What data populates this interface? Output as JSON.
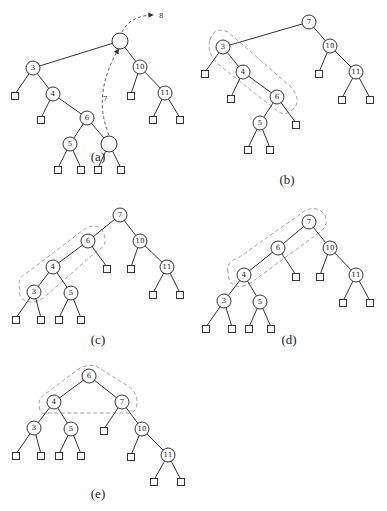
{
  "figure": {
    "panels": [
      {
        "id": "a",
        "caption": "(a)",
        "caption_pos": [
          98,
          161
        ],
        "nodes": [
          {
            "key": "",
            "x": 120,
            "y": 41
          },
          {
            "key": "3",
            "x": 33,
            "y": 68
          },
          {
            "key": "10",
            "x": 140,
            "y": 67
          },
          {
            "key": "4",
            "x": 53,
            "y": 94
          },
          {
            "key": "11",
            "x": 165,
            "y": 93
          },
          {
            "key": "6",
            "x": 87,
            "y": 118
          },
          {
            "key": "5",
            "x": 70,
            "y": 144
          },
          {
            "key": "",
            "x": 109,
            "y": 144
          }
        ],
        "edges": [
          [
            0,
            1
          ],
          [
            0,
            2
          ],
          [
            1,
            3
          ],
          [
            3,
            5
          ],
          [
            5,
            6
          ],
          [
            5,
            7
          ],
          [
            2,
            4
          ]
        ],
        "leaves": [
          {
            "x": 15,
            "y": 94,
            "parent": 1
          },
          {
            "x": 41,
            "y": 118,
            "parent": 3
          },
          {
            "x": 58,
            "y": 168,
            "parent": 6
          },
          {
            "x": 81,
            "y": 168,
            "parent": 6
          },
          {
            "x": 98,
            "y": 168,
            "parent": 7
          },
          {
            "x": 121,
            "y": 168,
            "parent": 7
          },
          {
            "x": 131,
            "y": 94,
            "parent": 2
          },
          {
            "x": 153,
            "y": 118,
            "parent": 4
          },
          {
            "x": 180,
            "y": 118,
            "parent": 4
          }
        ],
        "arrows": [
          {
            "label": "7",
            "path": "M 109 135 Q 92 95 118 50",
            "label_pos": [
              103,
              101
            ]
          },
          {
            "label": "8",
            "path": "M 122 32 Q 130 16 152 15",
            "label_pos": [
              159,
              18
            ]
          }
        ],
        "hull": null
      },
      {
        "id": "b",
        "caption": "(b)",
        "caption_pos": [
          287,
          184
        ],
        "nodes": [
          {
            "key": "7",
            "x": 309,
            "y": 22
          },
          {
            "key": "3",
            "x": 223,
            "y": 47
          },
          {
            "key": "10",
            "x": 330,
            "y": 46
          },
          {
            "key": "4",
            "x": 243,
            "y": 72
          },
          {
            "key": "11",
            "x": 356,
            "y": 72
          },
          {
            "key": "6",
            "x": 277,
            "y": 97
          },
          {
            "key": "5",
            "x": 260,
            "y": 123
          }
        ],
        "edges": [
          [
            0,
            1
          ],
          [
            0,
            2
          ],
          [
            1,
            3
          ],
          [
            3,
            5
          ],
          [
            5,
            6
          ],
          [
            2,
            4
          ]
        ],
        "leaves": [
          {
            "x": 205,
            "y": 72,
            "parent": 1
          },
          {
            "x": 231,
            "y": 97,
            "parent": 3
          },
          {
            "x": 296,
            "y": 123,
            "parent": 5
          },
          {
            "x": 248,
            "y": 148,
            "parent": 6
          },
          {
            "x": 270,
            "y": 148,
            "parent": 6
          },
          {
            "x": 319,
            "y": 72,
            "parent": 2
          },
          {
            "x": 342,
            "y": 98,
            "parent": 4
          },
          {
            "x": 370,
            "y": 98,
            "parent": 4
          }
        ],
        "arrows": [],
        "hull": "M 210 40 Q 214 26 228 32 L 290 86 Q 302 100 294 108 Q 286 118 276 110 L 218 64 Q 206 52 210 40 Z"
      },
      {
        "id": "c",
        "caption": "(c)",
        "caption_pos": [
          98,
          344
        ],
        "nodes": [
          {
            "key": "7",
            "x": 120,
            "y": 215
          },
          {
            "key": "6",
            "x": 88,
            "y": 241
          },
          {
            "key": "10",
            "x": 140,
            "y": 241
          },
          {
            "key": "4",
            "x": 53,
            "y": 267
          },
          {
            "key": "11",
            "x": 167,
            "y": 267
          },
          {
            "key": "3",
            "x": 34,
            "y": 292
          },
          {
            "key": "5",
            "x": 71,
            "y": 293
          }
        ],
        "edges": [
          [
            0,
            1
          ],
          [
            0,
            2
          ],
          [
            1,
            3
          ],
          [
            3,
            5
          ],
          [
            3,
            6
          ],
          [
            2,
            4
          ]
        ],
        "leaves": [
          {
            "x": 107,
            "y": 267,
            "parent": 1
          },
          {
            "x": 16,
            "y": 318,
            "parent": 5
          },
          {
            "x": 41,
            "y": 318,
            "parent": 5
          },
          {
            "x": 59,
            "y": 318,
            "parent": 6
          },
          {
            "x": 81,
            "y": 318,
            "parent": 6
          },
          {
            "x": 131,
            "y": 267,
            "parent": 2
          },
          {
            "x": 153,
            "y": 293,
            "parent": 4
          },
          {
            "x": 180,
            "y": 293,
            "parent": 4
          }
        ],
        "arrows": [],
        "hull": "M 20 290 Q 16 278 28 272 L 86 228 Q 100 222 104 234 Q 108 246 98 250 L 48 294 Q 36 306 24 300 Q 18 296 20 290 Z"
      },
      {
        "id": "d",
        "caption": "(d)",
        "caption_pos": [
          289,
          344
        ],
        "nodes": [
          {
            "key": "7",
            "x": 309,
            "y": 222
          },
          {
            "key": "6",
            "x": 278,
            "y": 248
          },
          {
            "key": "10",
            "x": 330,
            "y": 248
          },
          {
            "key": "4",
            "x": 244,
            "y": 275
          },
          {
            "key": "11",
            "x": 356,
            "y": 275
          },
          {
            "key": "3",
            "x": 224,
            "y": 301
          },
          {
            "key": "5",
            "x": 260,
            "y": 302
          }
        ],
        "edges": [
          [
            0,
            1
          ],
          [
            0,
            2
          ],
          [
            1,
            3
          ],
          [
            3,
            5
          ],
          [
            3,
            6
          ],
          [
            2,
            4
          ]
        ],
        "leaves": [
          {
            "x": 296,
            "y": 275,
            "parent": 1
          },
          {
            "x": 206,
            "y": 327,
            "parent": 5
          },
          {
            "x": 232,
            "y": 327,
            "parent": 5
          },
          {
            "x": 249,
            "y": 327,
            "parent": 6
          },
          {
            "x": 271,
            "y": 327,
            "parent": 6
          },
          {
            "x": 320,
            "y": 275,
            "parent": 2
          },
          {
            "x": 343,
            "y": 301,
            "parent": 4
          },
          {
            "x": 370,
            "y": 301,
            "parent": 4
          }
        ],
        "arrows": [],
        "hull": "M 228 272 Q 226 262 238 258 L 306 210 Q 318 206 324 214 Q 330 224 320 232 L 252 282 Q 240 290 232 284 Q 228 280 228 272 Z"
      },
      {
        "id": "e",
        "caption": "(e)",
        "caption_pos": [
          98,
          498
        ],
        "nodes": [
          {
            "key": "6",
            "x": 89,
            "y": 376
          },
          {
            "key": "4",
            "x": 54,
            "y": 402
          },
          {
            "key": "7",
            "x": 122,
            "y": 402
          },
          {
            "key": "3",
            "x": 34,
            "y": 428
          },
          {
            "key": "5",
            "x": 71,
            "y": 429
          },
          {
            "key": "10",
            "x": 142,
            "y": 429
          },
          {
            "key": "11",
            "x": 168,
            "y": 455
          }
        ],
        "edges": [
          [
            0,
            1
          ],
          [
            0,
            2
          ],
          [
            1,
            3
          ],
          [
            1,
            4
          ],
          [
            2,
            5
          ],
          [
            5,
            6
          ]
        ],
        "leaves": [
          {
            "x": 104,
            "y": 429,
            "parent": 2
          },
          {
            "x": 16,
            "y": 454,
            "parent": 3
          },
          {
            "x": 41,
            "y": 454,
            "parent": 3
          },
          {
            "x": 59,
            "y": 454,
            "parent": 4
          },
          {
            "x": 81,
            "y": 454,
            "parent": 4
          },
          {
            "x": 131,
            "y": 455,
            "parent": 5
          },
          {
            "x": 154,
            "y": 480,
            "parent": 6
          },
          {
            "x": 181,
            "y": 480,
            "parent": 6
          }
        ],
        "arrows": [],
        "hull": "M 40 410 Q 36 398 48 392 L 80 368 Q 88 364 96 366 L 128 386 Q 140 394 136 408 Q 134 414 126 413 L 46 413 Q 40 414 40 410 Z"
      }
    ]
  }
}
